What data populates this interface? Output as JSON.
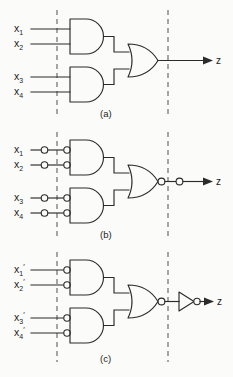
{
  "figure": {
    "background_color": "#fbfbf9",
    "line_color": "#2b2b2b",
    "cutline_color": "#6d6d6d"
  },
  "panels": [
    {
      "id": "a",
      "caption": "(a)",
      "gate_types": [
        "AND",
        "AND",
        "OR"
      ],
      "output_label": "z",
      "inputs": [
        {
          "base": "x",
          "sub": "1",
          "prime": ""
        },
        {
          "base": "x",
          "sub": "2",
          "prime": ""
        },
        {
          "base": "x",
          "sub": "3",
          "prime": ""
        },
        {
          "base": "x",
          "sub": "4",
          "prime": ""
        }
      ],
      "input_bubbles": false,
      "wire_bubbles": false,
      "output_bubble": false,
      "output_wire_bubble": false,
      "inverter": false
    },
    {
      "id": "b",
      "caption": "(b)",
      "gate_types": [
        "NAND",
        "NAND",
        "NOR"
      ],
      "output_label": "z",
      "inputs": [
        {
          "base": "x",
          "sub": "1",
          "prime": ""
        },
        {
          "base": "x",
          "sub": "2",
          "prime": ""
        },
        {
          "base": "x",
          "sub": "3",
          "prime": ""
        },
        {
          "base": "x",
          "sub": "4",
          "prime": ""
        }
      ],
      "input_bubbles": true,
      "wire_bubbles": true,
      "output_bubble": true,
      "output_wire_bubble": true,
      "inverter": false
    },
    {
      "id": "c",
      "caption": "(c)",
      "gate_types": [
        "NAND",
        "NAND",
        "NOR",
        "NOT"
      ],
      "output_label": "z",
      "inputs": [
        {
          "base": "x",
          "sub": "1",
          "prime": "′"
        },
        {
          "base": "x",
          "sub": "2",
          "prime": "′"
        },
        {
          "base": "x",
          "sub": "3",
          "prime": "′"
        },
        {
          "base": "x",
          "sub": "4",
          "prime": "′"
        }
      ],
      "input_bubbles": true,
      "wire_bubbles": false,
      "output_bubble": true,
      "output_wire_bubble": false,
      "inverter": true
    }
  ]
}
